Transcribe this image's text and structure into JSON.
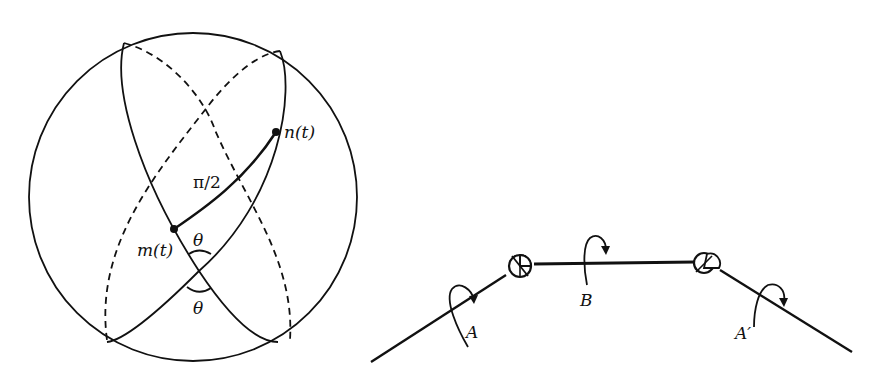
{
  "figure_left": {
    "title": "sphere-great-circles",
    "labels": {
      "n": "n(t)",
      "m": "m(t)",
      "arc": "π/2",
      "theta_top": "θ",
      "theta_bottom": "θ"
    }
  },
  "figure_right": {
    "title": "three-link-joint-chain",
    "labels": {
      "left_link": "A",
      "middle_link": "B",
      "right_link": "A′"
    }
  },
  "colors": {
    "ink": "#111111",
    "background": "#ffffff"
  }
}
